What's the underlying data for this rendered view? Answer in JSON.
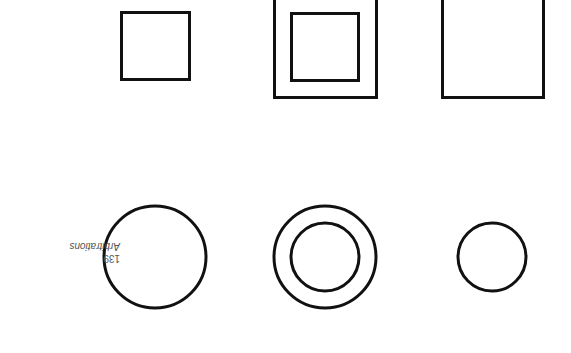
{
  "diagram": {
    "label": {
      "number": "139",
      "text": "Arbitrations",
      "orientation": "rotated 180deg"
    },
    "stroke_color": "#111111",
    "shapes": [
      {
        "type": "square",
        "x": 121,
        "y": 12,
        "w": 69,
        "h": 68
      },
      {
        "type": "rect",
        "x": 274,
        "y": -5,
        "w": 103,
        "h": 103
      },
      {
        "type": "square",
        "x": 291,
        "y": 13,
        "w": 68,
        "h": 68
      },
      {
        "type": "rect",
        "x": 442,
        "y": -5,
        "w": 102,
        "h": 103
      },
      {
        "type": "circle",
        "cx": 155,
        "cy": 257,
        "r": 51
      },
      {
        "type": "circle",
        "cx": 325,
        "cy": 257,
        "r": 51
      },
      {
        "type": "circle",
        "cx": 325,
        "cy": 257,
        "r": 34
      },
      {
        "type": "circle",
        "cx": 492,
        "cy": 257,
        "r": 34
      }
    ]
  }
}
